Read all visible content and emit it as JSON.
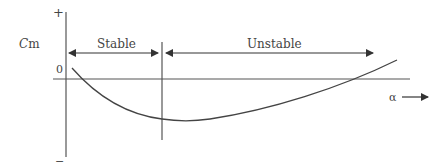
{
  "diagram": {
    "title": "",
    "y_axis": {
      "label_italic": "C",
      "label_rest": "m",
      "plus_sign": "+",
      "minus_sign": "−",
      "zero_label": "0"
    },
    "x_axis": {
      "label": "α",
      "direction": "increasing to the right"
    },
    "regions": [
      {
        "name": "stable",
        "label": "Stable"
      },
      {
        "name": "unstable",
        "label": "Unstable"
      }
    ],
    "curve": {
      "description": "Cm vs angle of attack: starts slightly positive, decreases to a minimum near the stable/unstable boundary, then increases and crosses zero back to positive",
      "shape": "U-shaped, minimum just right of boundary"
    },
    "colors": {
      "line": "#444444",
      "axis": "#555555",
      "text": "#444444",
      "background": "#ffffff"
    }
  }
}
